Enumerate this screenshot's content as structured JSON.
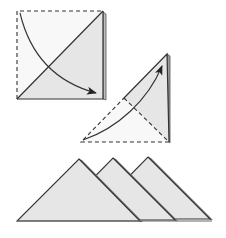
{
  "diagram": {
    "type": "origami-folding-instructions",
    "colors": {
      "paper_fill": "#e6e6e6",
      "paper_white": "#f8f8f8",
      "edge": "#333333",
      "shadow_layer": "#8a8a8a",
      "dash": "#333333",
      "arrow": "#333333"
    },
    "steps": [
      {
        "id": 1,
        "description": "Square folded diagonally; dashed top and left edges; curved arrow from top-left corner to bottom-right",
        "square": {
          "x1": 17,
          "y1": 11,
          "x2": 103,
          "y2": 99
        },
        "arrow": {
          "from": [
            20,
            13
          ],
          "to": [
            97,
            93
          ]
        }
      },
      {
        "id": 2,
        "description": "Triangle with dashed fold lines; curved arrow from bottom-left upward to apex",
        "apex": [
          167,
          54
        ],
        "mid_left": [
          124,
          98
        ],
        "bottom_left": [
          81,
          142
        ],
        "bottom_right": [
          169,
          142
        ],
        "arrow": {
          "from": [
            83,
            140
          ],
          "to": [
            162,
            65
          ]
        }
      },
      {
        "id": 3,
        "description": "Three overlapping folded triangles in a row",
        "triangles": [
          {
            "apex": [
              79,
              159
            ],
            "left": [
              17,
              221
            ],
            "right": [
              140,
              221
            ]
          },
          {
            "apex": [
              113,
              158
            ],
            "left": [
              52,
              220
            ],
            "right": [
              175,
              220
            ]
          },
          {
            "apex": [
              148,
              157
            ],
            "left": [
              87,
              219
            ],
            "right": [
              210,
              219
            ]
          }
        ]
      }
    ]
  }
}
